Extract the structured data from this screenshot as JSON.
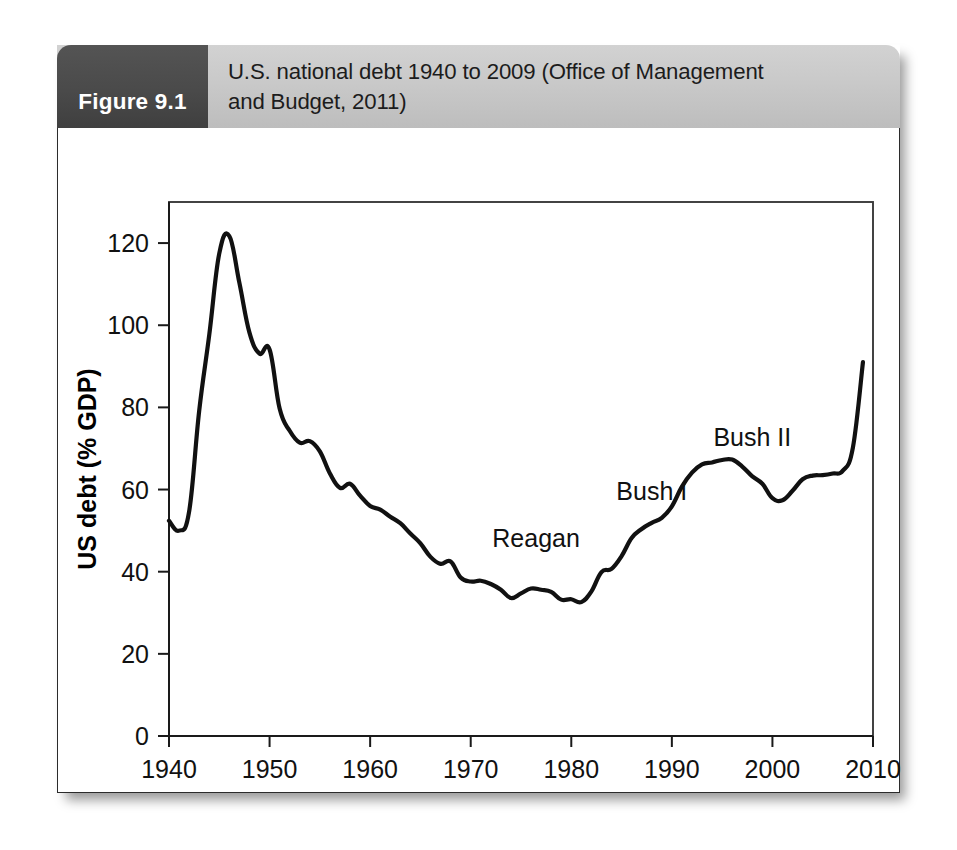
{
  "figure": {
    "number_label": "Figure 9.1",
    "caption": "U.S. national debt 1940 to 2009 (Office of Management and Budget, 2011)",
    "caption_line_1": "U.S. national debt 1940 to 2009 (Office of Management",
    "caption_line_2": "and Budget, 2011)"
  },
  "colors": {
    "figure_number_bg": "#4a4a4a",
    "caption_bg": "#c9c9c9",
    "line": "#111111",
    "axis": "#1a1a1a",
    "card_bg": "#ffffff",
    "page_bg": "#ffffff"
  },
  "chart_data": {
    "type": "line",
    "title": "",
    "xlabel": "Year",
    "ylabel": "US debt (% GDP)",
    "xlim": [
      1940,
      2010
    ],
    "ylim": [
      0,
      130
    ],
    "xticks": [
      1940,
      1950,
      1960,
      1970,
      1980,
      1990,
      2000,
      2010
    ],
    "xtick_labels": [
      "1940",
      "1950",
      "1960",
      "1970",
      "1980",
      "1990",
      "2000",
      "2010"
    ],
    "yticks": [
      0,
      20,
      40,
      60,
      80,
      100,
      120
    ],
    "ytick_labels": [
      "0",
      "20",
      "40",
      "60",
      "80",
      "100",
      "120"
    ],
    "grid": false,
    "legend": "none",
    "series": [
      {
        "name": "US debt (% GDP)",
        "x": [
          1940,
          1941,
          1942,
          1943,
          1944,
          1945,
          1946,
          1947,
          1948,
          1949,
          1950,
          1951,
          1952,
          1953,
          1954,
          1955,
          1956,
          1957,
          1958,
          1959,
          1960,
          1961,
          1962,
          1963,
          1964,
          1965,
          1966,
          1967,
          1968,
          1969,
          1970,
          1971,
          1972,
          1973,
          1974,
          1975,
          1976,
          1977,
          1978,
          1979,
          1980,
          1981,
          1982,
          1983,
          1984,
          1985,
          1986,
          1987,
          1988,
          1989,
          1990,
          1991,
          1992,
          1993,
          1994,
          1995,
          1996,
          1997,
          1998,
          1999,
          2000,
          2001,
          2002,
          2003,
          2004,
          2005,
          2006,
          2007,
          2008,
          2009
        ],
        "y": [
          52.4,
          50.0,
          54.6,
          79.1,
          97.6,
          117.5,
          121.7,
          110.3,
          98.2,
          93.1,
          94.1,
          79.7,
          74.3,
          71.4,
          71.8,
          69.3,
          63.9,
          60.4,
          61.4,
          58.5,
          56.0,
          55.1,
          53.4,
          51.8,
          49.3,
          46.9,
          43.6,
          41.9,
          42.5,
          38.6,
          37.6,
          37.8,
          37.0,
          35.6,
          33.6,
          34.7,
          35.9,
          35.6,
          35.1,
          33.2,
          33.3,
          32.6,
          35.2,
          39.9,
          40.7,
          43.8,
          48.2,
          50.4,
          51.9,
          53.1,
          55.9,
          60.7,
          64.1,
          66.1,
          66.6,
          67.2,
          67.3,
          65.6,
          63.2,
          61.4,
          57.9,
          57.4,
          59.7,
          62.5,
          63.4,
          63.5,
          63.9,
          64.6,
          70.2,
          91.0
        ]
      }
    ],
    "annotations": [
      {
        "text": "Reagan",
        "x": 1976.5,
        "y": 46.0
      },
      {
        "text": "Bush I",
        "x": 1988.0,
        "y": 57.5
      },
      {
        "text": "Bush II",
        "x": 1998.0,
        "y": 70.5
      }
    ]
  }
}
